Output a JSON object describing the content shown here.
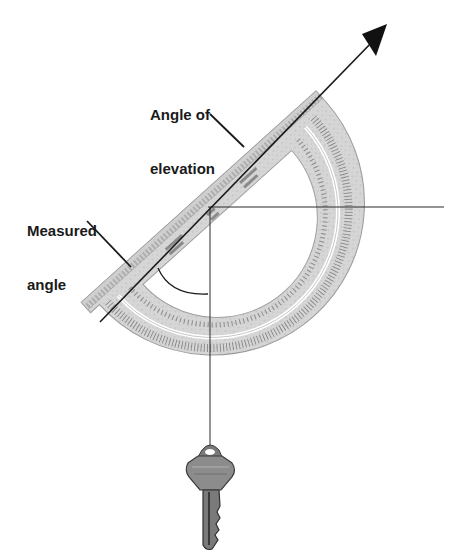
{
  "figure": {
    "type": "diagram",
    "labels": {
      "angle_of_elevation": {
        "line1": "Angle of",
        "line2": "elevation"
      },
      "measured_angle": {
        "line1": "Measured",
        "line2": "angle"
      }
    },
    "objects": {
      "protractor": {
        "shape": "semicircle",
        "tilt_degrees": 42
      },
      "sight_line": {
        "style": "arrow",
        "direction": "up-right"
      },
      "horizontal_line": {
        "style": "thin line"
      },
      "plumb_line": {
        "style": "thin vertical line",
        "weight": "key"
      },
      "measured_angle_arc": {
        "style": "arc"
      }
    },
    "colors": {
      "ink": "#1a1a1a",
      "protractor_fill": "#d4d4d4",
      "protractor_edge": "#9a9a9a",
      "background": "#ffffff",
      "key_fill": "#8c8c8c"
    }
  }
}
